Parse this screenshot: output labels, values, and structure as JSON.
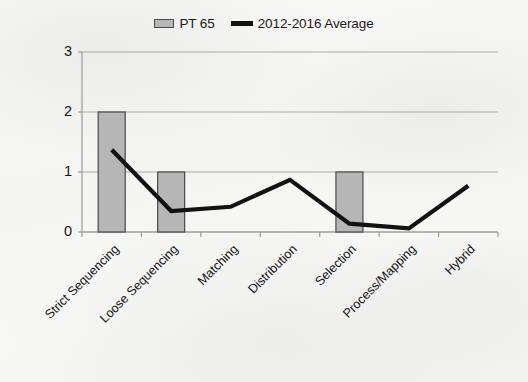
{
  "legend": {
    "entries": [
      {
        "label": "PT 65",
        "marker": "bar-swatch",
        "color": "#b6b6b6"
      },
      {
        "label": "2012-2016 Average",
        "marker": "line-swatch",
        "color": "#121212"
      }
    ]
  },
  "colors": {
    "background": "#f7f7f6",
    "bar_fill": "#b6b6b6",
    "bar_border": "#4a4a4a",
    "line": "#121212",
    "gridline": "#a9a9a9",
    "axis": "#9a9a9a",
    "text": "#141414"
  },
  "axes": {
    "y_ticks": [
      "0",
      "1",
      "2",
      "3"
    ],
    "x_ticks": [
      "Strict Sequencing",
      "Loose Sequencing",
      "Matching",
      "Distribution",
      "Selection",
      "Process/Mapping",
      "Hybrid"
    ]
  },
  "chart_data": {
    "type": "bar",
    "title": "",
    "xlabel": "",
    "ylabel": "",
    "ylim": [
      0,
      3
    ],
    "grid": true,
    "legend_position": "top-center",
    "categories": [
      "Strict Sequencing",
      "Loose Sequencing",
      "Matching",
      "Distribution",
      "Selection",
      "Process/Mapping",
      "Hybrid"
    ],
    "series": [
      {
        "name": "PT 65",
        "type": "bar",
        "color": "#b6b6b6",
        "values": [
          2,
          1,
          0,
          0,
          1,
          0,
          0
        ]
      },
      {
        "name": "2012-2016 Average",
        "type": "line",
        "color": "#121212",
        "values": [
          1.37,
          0.35,
          0.42,
          0.87,
          0.14,
          0.06,
          0.77
        ]
      }
    ]
  }
}
